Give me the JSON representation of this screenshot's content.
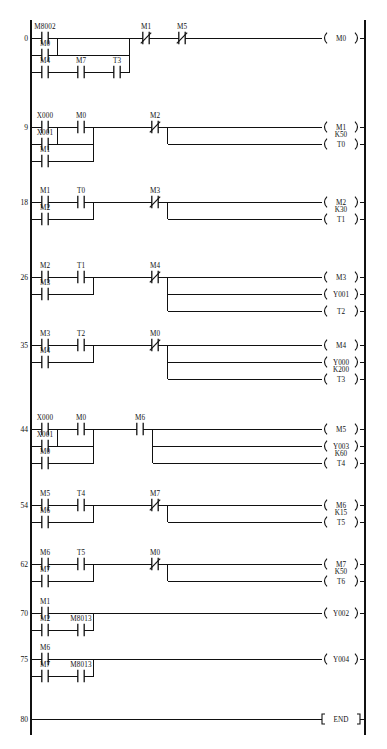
{
  "diagram": {
    "kind": "plc-ladder-diagram",
    "end_label": "END",
    "left_rail_x": 31,
    "right_rail_x": 365,
    "rungs": [
      {
        "number": "0",
        "branches": [
          {
            "row": 0,
            "contacts": [
              {
                "label": "M8002",
                "type": "NO"
              }
            ]
          },
          {
            "row": 1,
            "contacts": [
              {
                "label": "M0",
                "type": "NO"
              }
            ]
          },
          {
            "row": 2,
            "contacts": [
              {
                "label": "M4",
                "type": "NO"
              },
              {
                "label": "M7",
                "type": "NO"
              },
              {
                "label": "T3",
                "type": "NO"
              }
            ]
          }
        ],
        "series_after": [
          {
            "label": "M1",
            "type": "NC"
          },
          {
            "label": "M5",
            "type": "NC"
          }
        ],
        "outputs": [
          {
            "label": "M0",
            "k": "",
            "type": "coil"
          }
        ]
      },
      {
        "number": "9",
        "branches": [
          {
            "row": 0,
            "contacts": [
              {
                "label": "X000",
                "type": "NO"
              },
              {
                "label": "M0",
                "type": "NO"
              }
            ]
          },
          {
            "row": 1,
            "contacts": [
              {
                "label": "X001",
                "type": "NO"
              }
            ]
          },
          {
            "row": 2,
            "contacts": [
              {
                "label": "M1",
                "type": "NO"
              }
            ]
          }
        ],
        "series_after": [
          {
            "label": "M2",
            "type": "NC"
          }
        ],
        "outputs": [
          {
            "label": "M1",
            "k": "",
            "type": "coil"
          },
          {
            "label": "T0",
            "k": "K50",
            "type": "timer"
          }
        ]
      },
      {
        "number": "18",
        "branches": [
          {
            "row": 0,
            "contacts": [
              {
                "label": "M1",
                "type": "NO"
              },
              {
                "label": "T0",
                "type": "NO"
              }
            ]
          },
          {
            "row": 1,
            "contacts": [
              {
                "label": "M2",
                "type": "NO"
              }
            ]
          }
        ],
        "series_after": [
          {
            "label": "M3",
            "type": "NC"
          }
        ],
        "outputs": [
          {
            "label": "M2",
            "k": "",
            "type": "coil"
          },
          {
            "label": "T1",
            "k": "K30",
            "type": "timer"
          }
        ]
      },
      {
        "number": "26",
        "branches": [
          {
            "row": 0,
            "contacts": [
              {
                "label": "M2",
                "type": "NO"
              },
              {
                "label": "T1",
                "type": "NO"
              }
            ]
          },
          {
            "row": 1,
            "contacts": [
              {
                "label": "M3",
                "type": "NO"
              }
            ]
          }
        ],
        "series_after": [
          {
            "label": "M4",
            "type": "NC"
          }
        ],
        "outputs": [
          {
            "label": "M3",
            "k": "",
            "type": "coil"
          },
          {
            "label": "Y001",
            "k": "",
            "type": "coil"
          },
          {
            "label": "T2",
            "k": "",
            "type": "timer"
          }
        ]
      },
      {
        "number": "35",
        "branches": [
          {
            "row": 0,
            "contacts": [
              {
                "label": "M3",
                "type": "NO"
              },
              {
                "label": "T2",
                "type": "NO"
              }
            ]
          },
          {
            "row": 1,
            "contacts": [
              {
                "label": "M4",
                "type": "NO"
              }
            ]
          }
        ],
        "series_after": [
          {
            "label": "M0",
            "type": "NC"
          }
        ],
        "outputs": [
          {
            "label": "M4",
            "k": "",
            "type": "coil"
          },
          {
            "label": "Y000",
            "k": "",
            "type": "coil"
          },
          {
            "label": "T3",
            "k": "K200",
            "type": "timer"
          }
        ]
      },
      {
        "number": "44",
        "branches": [
          {
            "row": 0,
            "contacts": [
              {
                "label": "X000",
                "type": "NO"
              },
              {
                "label": "M0",
                "type": "NO"
              }
            ]
          },
          {
            "row": 1,
            "contacts": [
              {
                "label": "X001",
                "type": "NO"
              }
            ]
          },
          {
            "row": 2,
            "contacts": [
              {
                "label": "M0",
                "type": "NO"
              }
            ]
          }
        ],
        "series_after": [
          {
            "label": "M6",
            "type": "NO"
          }
        ],
        "outputs": [
          {
            "label": "M5",
            "k": "",
            "type": "coil"
          },
          {
            "label": "Y003",
            "k": "",
            "type": "coil"
          },
          {
            "label": "T4",
            "k": "K60",
            "type": "timer"
          }
        ]
      },
      {
        "number": "54",
        "branches": [
          {
            "row": 0,
            "contacts": [
              {
                "label": "M5",
                "type": "NO"
              },
              {
                "label": "T4",
                "type": "NO"
              }
            ]
          },
          {
            "row": 1,
            "contacts": [
              {
                "label": "M6",
                "type": "NO"
              }
            ]
          }
        ],
        "series_after": [
          {
            "label": "M7",
            "type": "NC"
          }
        ],
        "outputs": [
          {
            "label": "M6",
            "k": "",
            "type": "coil"
          },
          {
            "label": "T5",
            "k": "K15",
            "type": "timer"
          }
        ]
      },
      {
        "number": "62",
        "branches": [
          {
            "row": 0,
            "contacts": [
              {
                "label": "M6",
                "type": "NO"
              },
              {
                "label": "T5",
                "type": "NO"
              }
            ]
          },
          {
            "row": 1,
            "contacts": [
              {
                "label": "M7",
                "type": "NO"
              }
            ]
          }
        ],
        "series_after": [
          {
            "label": "M0",
            "type": "NC"
          }
        ],
        "outputs": [
          {
            "label": "M7",
            "k": "",
            "type": "coil"
          },
          {
            "label": "T6",
            "k": "K50",
            "type": "timer"
          }
        ]
      },
      {
        "number": "70",
        "branches": [
          {
            "row": 0,
            "contacts": [
              {
                "label": "M1",
                "type": "NO"
              }
            ]
          },
          {
            "row": 1,
            "contacts": [
              {
                "label": "M2",
                "type": "NO"
              },
              {
                "label": "M8013",
                "type": "NO"
              }
            ]
          }
        ],
        "series_after": [],
        "outputs": [
          {
            "label": "Y002",
            "k": "",
            "type": "coil"
          }
        ]
      },
      {
        "number": "75",
        "branches": [
          {
            "row": 0,
            "contacts": [
              {
                "label": "M6",
                "type": "NO"
              }
            ]
          },
          {
            "row": 1,
            "contacts": [
              {
                "label": "M7",
                "type": "NO"
              },
              {
                "label": "M8013",
                "type": "NO"
              }
            ]
          }
        ],
        "series_after": [],
        "outputs": [
          {
            "label": "Y004",
            "k": "",
            "type": "coil"
          }
        ]
      },
      {
        "number": "80",
        "branches": [],
        "series_after": [],
        "outputs": [
          {
            "label": "END",
            "k": "",
            "type": "end"
          }
        ]
      }
    ],
    "colors": {
      "line": "#111111",
      "background": "#ffffff",
      "text": "#111111"
    }
  }
}
